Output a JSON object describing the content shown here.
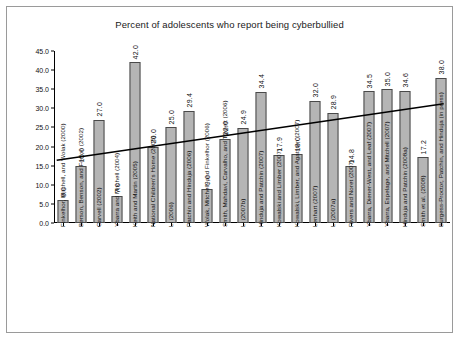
{
  "chart_data": {
    "type": "bar",
    "title": "Percent of adolescents who report being cyberbullied",
    "xlabel": "",
    "ylabel": "",
    "ylim": [
      0.0,
      45.0
    ],
    "ytick_step": 5.0,
    "yticks": [
      "45.0",
      "40.0",
      "35.0",
      "30.0",
      "25.0",
      "20.0",
      "15.0",
      "10.0",
      "5.0",
      "0.0"
    ],
    "grid": false,
    "legend": "none",
    "bar_color": "#b5b5b5",
    "bar_border_color": "#4a4a4a",
    "trendline": {
      "type": "linear",
      "color": "#000000",
      "start_value": 16.4,
      "end_value": 31.2,
      "visible": true
    },
    "categories": [
      "Finkelhor, Mitchell, and Wolak (2000)",
      "Berson, Benson, and Ferron (2002)",
      "Carvell (2002)",
      "Ybarra and Mitchell (2004)",
      "Keith and Martin (2005)",
      "National Children's Home (2005)",
      "Li (2006)",
      "Patchin and Hinduja (2006)",
      "Wolak, Mitchell, and Finkelhor (2006)",
      "Smith, Mahdavi, Carvalho, and Tippett (2006)",
      "Li (2007b)",
      "Hinduja and Patchin (2007)",
      "Kowalski and Limber (2007)",
      "Kowalski, Limber, and Agatston (2007)",
      "Lenhart (2007)",
      "Li (2007a)",
      "Rivers and Noret (2007)",
      "Ybarra, Diener-West, and Leaf (2007)",
      "Ybarra, Espelage, and Mitchell (2007)",
      "Hinduja and Patchin (2008a)",
      "Smith et al. (2008)",
      "Burgess-Proctor, Patchin, and Hinduja (in press)"
    ],
    "values": [
      6.0,
      15.0,
      27.0,
      7.0,
      42.0,
      20.0,
      25.0,
      29.4,
      9.0,
      22.0,
      24.9,
      34.4,
      17.9,
      18.0,
      32.0,
      28.9,
      14.8,
      34.5,
      35.0,
      34.6,
      17.2,
      38.0
    ],
    "value_labels": [
      "6.0",
      "15.0",
      "27.0",
      "7.0",
      "42.0",
      "20.0",
      "25.0",
      "29.4",
      "9.0",
      "22.0",
      "24.9",
      "34.4",
      "17.9",
      "18.0",
      "32.0",
      "28.9",
      "14.8",
      "34.5",
      "35.0",
      "34.6",
      "17.2",
      "38.0"
    ]
  }
}
